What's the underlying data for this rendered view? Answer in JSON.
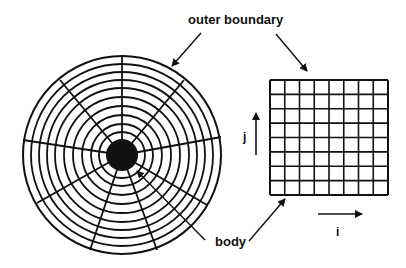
{
  "labels": {
    "outer_boundary": "outer boundary",
    "body": "body",
    "i_axis": "i",
    "j_axis": "j"
  },
  "colors": {
    "ink": "#111111",
    "background": "#ffffff"
  },
  "polar_grid": {
    "center": [
      122,
      155
    ],
    "body_radius": 16,
    "ring_radii": [
      99,
      91,
      83,
      75,
      67,
      58,
      49,
      40,
      31,
      23
    ],
    "spoke_endpoints": [
      [
        122,
        57
      ],
      [
        60,
        80
      ],
      [
        23,
        140
      ],
      [
        37,
        203
      ],
      [
        90,
        250
      ],
      [
        157,
        250
      ],
      [
        207,
        205
      ],
      [
        221,
        137
      ],
      [
        184,
        80
      ]
    ]
  },
  "cartesian_grid": {
    "x": 270,
    "y": 80,
    "width": 118,
    "height": 115,
    "columns": 8,
    "rows": 8
  }
}
